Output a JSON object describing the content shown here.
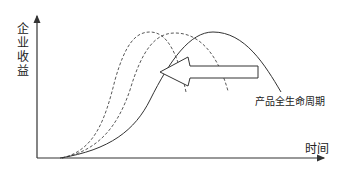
{
  "diagram": {
    "y_axis_label": [
      "企",
      "业",
      "收",
      "益"
    ],
    "y_axis_title": "企业收益",
    "x_axis_title": "时间",
    "curve_label": "产品全生命周期",
    "curves": [
      {
        "name": "current-lifecycle",
        "style": "solid"
      },
      {
        "name": "shortened-lifecycle-1",
        "style": "dashed"
      },
      {
        "name": "shortened-lifecycle-2",
        "style": "dashed"
      }
    ],
    "arrow": {
      "direction": "left",
      "meaning": "lifecycle shortening"
    },
    "colors": {
      "stroke": "#333333",
      "text": "#222222",
      "background": "#ffffff"
    }
  }
}
